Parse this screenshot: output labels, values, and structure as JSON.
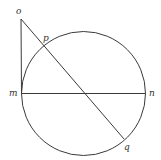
{
  "diagram": {
    "type": "geometry",
    "colors": {
      "stroke": "#3a3a3a",
      "label": "#333333",
      "background": "#ffffff"
    },
    "circle": {
      "cx": 83.5,
      "cy": 93.5,
      "r": 62
    },
    "points": {
      "o": {
        "label": "o",
        "x": 21,
        "y": 19
      },
      "p": {
        "label": "p",
        "x": 44,
        "y": 46
      },
      "m": {
        "label": "m",
        "x": 21.5,
        "y": 93.5
      },
      "n": {
        "label": "n",
        "x": 145.5,
        "y": 93.5
      },
      "q": {
        "label": "q",
        "x": 124,
        "y": 139
      }
    },
    "segments": [
      {
        "from": "o",
        "to": "m"
      },
      {
        "from": "m",
        "to": "n"
      },
      {
        "from": "o",
        "to": "q"
      }
    ]
  }
}
